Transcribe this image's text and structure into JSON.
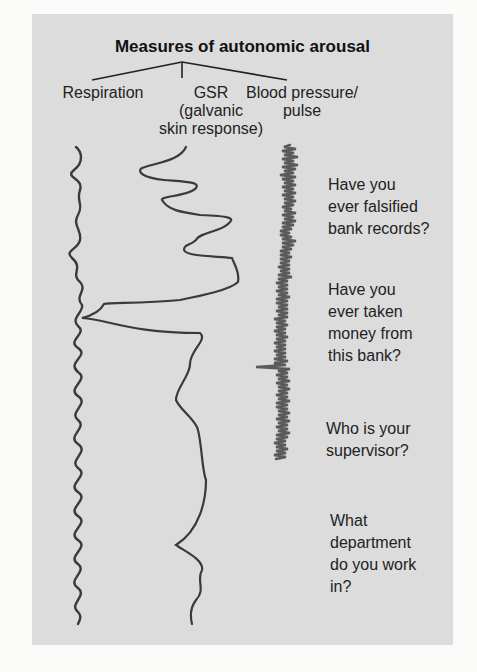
{
  "title": "Measures of autonomic arousal",
  "measures": [
    {
      "label_line1": "Respiration",
      "label_line2": "",
      "label_line3": ""
    },
    {
      "label_line1": "GSR",
      "label_line2": "(galvanic",
      "label_line3": "skin response)"
    },
    {
      "label_line1": "Blood pressure/",
      "label_line2": "pulse",
      "label_line3": ""
    }
  ],
  "questions": [
    {
      "l1": "Have you",
      "l2": "ever falsified",
      "l3": "bank records?",
      "l4": ""
    },
    {
      "l1": "Have you",
      "l2": "ever taken",
      "l3": "money from",
      "l4": "this bank?"
    },
    {
      "l1": "Who is your",
      "l2": "supervisor?",
      "l3": "",
      "l4": ""
    },
    {
      "l1": "What",
      "l2": "department",
      "l3": "do you work",
      "l4": "in?"
    }
  ],
  "colors": {
    "panel": "#dcdcdc",
    "trace": "#3a3a3a",
    "pulse_trace": "#5a5a5a"
  }
}
